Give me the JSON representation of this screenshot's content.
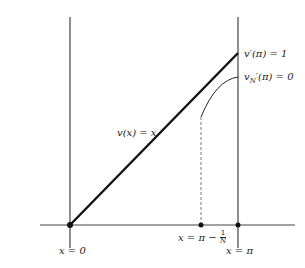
{
  "diagram": {
    "labels": {
      "v_derivative_pi": "v′(π) = 1",
      "vN_derivative_pi_prefix": "v",
      "vN_derivative_pi_sub": "N",
      "vN_derivative_pi_suffix": "′(π) = 0",
      "v_of_x": "v(x) = x",
      "x_zero": "x = 0",
      "x_pi": "x = π",
      "x_pi_minus_prefix": "x = π −",
      "frac_num": "1",
      "frac_den": "N"
    },
    "colors": {
      "line": "#222222",
      "axis": "#444444"
    }
  }
}
